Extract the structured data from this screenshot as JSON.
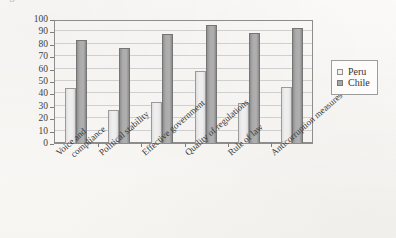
{
  "title_fragment": "Figure. Governance indicators",
  "chart_data": {
    "type": "bar",
    "title": "",
    "xlabel": "",
    "ylabel": "",
    "ylim": [
      0,
      100
    ],
    "ytick_step": 10,
    "yticks": [
      100,
      90,
      80,
      70,
      60,
      50,
      40,
      30,
      20,
      10,
      0
    ],
    "grid": true,
    "legend_position": "right",
    "categories": [
      "Voice and compliance",
      "Political stability",
      "Effective government",
      "Quality of regulations",
      "Rule of law",
      "Anticorruption measures"
    ],
    "category_lines": [
      [
        "Voice and",
        "compliance"
      ],
      [
        "Political stability",
        ""
      ],
      [
        "Effective government",
        ""
      ],
      [
        "Quality of regulations",
        ""
      ],
      [
        "Rule of law",
        ""
      ],
      [
        "Anticorruption measures",
        ""
      ]
    ],
    "series": [
      {
        "name": "Peru",
        "color": "#eeeeee",
        "values": [
          44,
          27,
          33,
          58,
          32,
          45
        ]
      },
      {
        "name": "Chile",
        "color": "#a9a9a9",
        "values": [
          83,
          77,
          88,
          95,
          89,
          93
        ]
      }
    ]
  },
  "legend": {
    "items": [
      {
        "label": "Peru",
        "color": "#eeeeee"
      },
      {
        "label": "Chile",
        "color": "#a9a9a9"
      }
    ]
  }
}
